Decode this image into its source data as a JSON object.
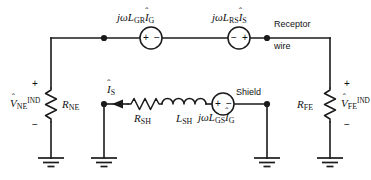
{
  "diagram": {
    "background_color": "#ffffff",
    "line_color": "#1a1a1a"
  },
  "sources": {
    "gr": {
      "label_prefix": "jωL",
      "label_sub1": "GR",
      "label_var": "I",
      "label_sub2": "G",
      "hat": "ˆ",
      "plus_side": "left",
      "minus_side": "right",
      "plus": "+",
      "minus": "−"
    },
    "rs": {
      "label_prefix": "jωL",
      "label_sub1": "RS",
      "label_var": "I",
      "label_sub2": "S",
      "hat": "ˆ",
      "plus_side": "right",
      "minus_side": "left",
      "plus": "+",
      "minus": "−"
    },
    "gs": {
      "label_prefix": "jωL",
      "label_sub1": "GS",
      "label_var": "I",
      "label_sub2": "G",
      "hat": "ˆ",
      "plus_side": "left",
      "minus_side": "right",
      "plus": "+",
      "minus": "−"
    }
  },
  "resistors": {
    "ne": {
      "symbol": "R",
      "sub": "NE"
    },
    "fe": {
      "symbol": "R",
      "sub": "FE"
    },
    "sh": {
      "symbol": "R",
      "sub": "SH"
    }
  },
  "inductors": {
    "sh": {
      "symbol": "L",
      "sub": "SH"
    }
  },
  "voltages": {
    "ne": {
      "symbol": "V",
      "hat": "ˆ",
      "sub": "NE",
      "sup": "IND",
      "plus": "+",
      "minus": "−"
    },
    "fe": {
      "symbol": "V",
      "hat": "ˆ",
      "sub": "FE",
      "sup": "IND",
      "plus": "+",
      "minus": "−"
    }
  },
  "currents": {
    "shield": {
      "symbol": "I",
      "hat": "ˆ",
      "sub": "S",
      "direction": "left"
    }
  },
  "annotations": {
    "receptor_line1": "Receptor",
    "receptor_line2": "wire",
    "shield": "Shield"
  },
  "grounds": [
    {
      "name": "ground-ne"
    },
    {
      "name": "ground-shield-left"
    },
    {
      "name": "ground-shield-right"
    },
    {
      "name": "ground-fe"
    }
  ]
}
